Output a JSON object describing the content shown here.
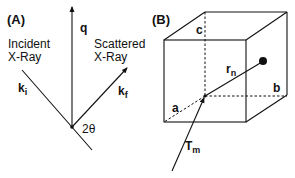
{
  "figure": {
    "panel_a": {
      "label": "(A)",
      "incident": {
        "line1": "Incident",
        "line2": "X-Ray"
      },
      "scattered": {
        "line1": "Scattered",
        "line2": "X-Ray"
      },
      "q": "q",
      "ki": {
        "main": "k",
        "sub": "i"
      },
      "kf": {
        "main": "k",
        "sub": "f"
      },
      "angle": "2θ"
    },
    "panel_b": {
      "label": "(B)",
      "axis_a": "a",
      "axis_b": "b",
      "axis_c": "c",
      "rn": {
        "main": "r",
        "sub": "n"
      },
      "tm": {
        "main": "T",
        "sub": "m"
      }
    },
    "colors": {
      "stroke": "#111111",
      "background": "#ffffff"
    }
  }
}
